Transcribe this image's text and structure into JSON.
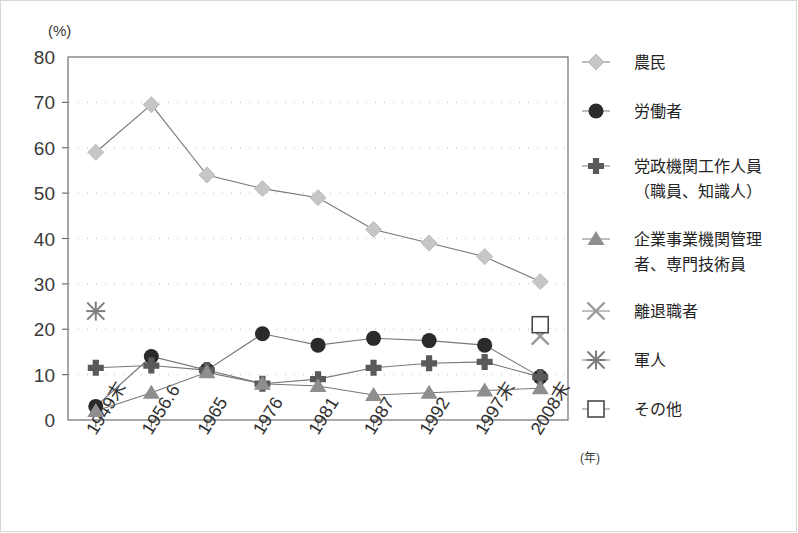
{
  "chart_data": {
    "type": "line",
    "title": "",
    "xlabel": "(年)",
    "ylabel": "(%)",
    "ylim": [
      0,
      80
    ],
    "ytick_step": 10,
    "yticks": [
      "0",
      "10",
      "20",
      "30",
      "40",
      "50",
      "60",
      "70",
      "80"
    ],
    "grid": "dotted-horizontal",
    "legend_position": "right",
    "categories": [
      "1949末",
      "1956.6",
      "1965",
      "1976",
      "1981",
      "1987",
      "1992",
      "1997末",
      "2008末"
    ],
    "series": [
      {
        "name": "農民",
        "marker": "diamond",
        "color": "#c6c6c6",
        "values": [
          59,
          69.5,
          54,
          51,
          49,
          42,
          39,
          36,
          30.5
        ]
      },
      {
        "name": "労働者",
        "marker": "circle",
        "color": "#2a2a2a",
        "values": [
          3,
          14,
          11,
          19,
          16.5,
          18,
          17.5,
          16.5,
          9.5
        ]
      },
      {
        "name": "党政機関工作人員\n（職員、知識人）",
        "name_line1": "党政機関工作人員",
        "name_line2": "（職員、知識人）",
        "marker": "plus",
        "color": "#5a5a5a",
        "values": [
          11.5,
          12,
          11,
          8,
          9,
          11.5,
          12.5,
          12.8,
          9.5
        ]
      },
      {
        "name": "企業事業機関管理\n者、専門技術員",
        "name_line1": "企業事業機関管理",
        "name_line2": "者、専門技術員",
        "marker": "triangle",
        "color": "#8e8e8e",
        "values": [
          2,
          6,
          10.5,
          8,
          7.5,
          5.5,
          6,
          6.5,
          7
        ]
      },
      {
        "name": "離退職者",
        "marker": "cross-x",
        "color": "#9a9a9a",
        "values": [
          null,
          null,
          null,
          null,
          null,
          null,
          null,
          null,
          18.5
        ]
      },
      {
        "name": "軍人",
        "marker": "asterisk",
        "color": "#7d7d7d",
        "values": [
          24,
          null,
          null,
          null,
          null,
          null,
          null,
          null,
          null
        ]
      },
      {
        "name": "その他",
        "marker": "square",
        "color": "#ffffff",
        "values": [
          null,
          null,
          null,
          null,
          null,
          null,
          null,
          null,
          21
        ]
      }
    ]
  },
  "legend": {
    "entries": [
      {
        "label": "農民",
        "icon": "diamond-marker-icon"
      },
      {
        "label": "労働者",
        "icon": "circle-marker-icon"
      },
      {
        "label": "党政機関工作人員",
        "label2": "（職員、知識人）",
        "icon": "plus-marker-icon"
      },
      {
        "label": "企業事業機関管理",
        "label2": "者、専門技術員",
        "icon": "triangle-marker-icon"
      },
      {
        "label": "離退職者",
        "icon": "cross-marker-icon"
      },
      {
        "label": "軍人",
        "icon": "asterisk-marker-icon"
      },
      {
        "label": "その他",
        "icon": "square-marker-icon"
      }
    ]
  },
  "axes": {
    "y_unit": "(%)",
    "x_unit": "(年)"
  },
  "colors": {
    "axis": "#6e6e6e",
    "grid": "#b9b9b9",
    "text": "#2f2f2f",
    "frame": "#d8d8d8"
  }
}
